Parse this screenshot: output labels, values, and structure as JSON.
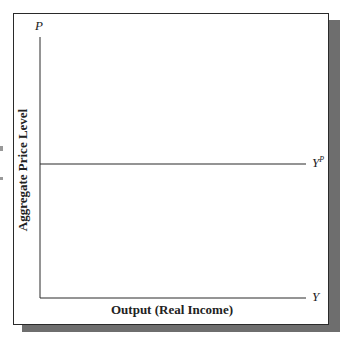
{
  "diagram": {
    "y_axis_symbol": "P",
    "x_axis_symbol": "Y",
    "y_axis_label": "Aggregate Price Level",
    "x_axis_label": "Output (Real Income)",
    "curve_label": "Y",
    "curve_label_superscript": "P",
    "curve_type": "horizontal line"
  },
  "colors": {
    "line": "#2a2a2a",
    "shadow": "#6e6e6e",
    "background": "#ffffff"
  }
}
